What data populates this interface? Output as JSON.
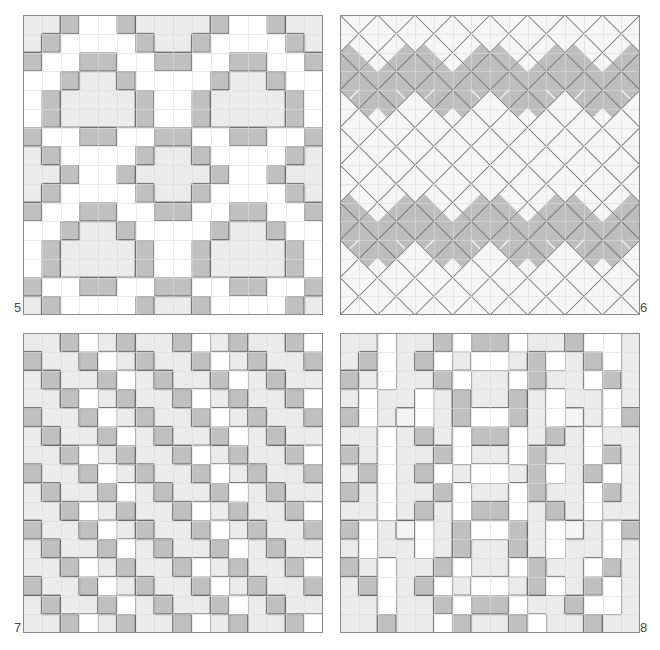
{
  "sheet": {
    "width": 660,
    "height": 650,
    "background": "#ffffff",
    "description": "Four numbered mosaic tiling pattern plates arranged two by two"
  },
  "palette": {
    "white": "#ffffff",
    "light_gray": "#ebebeb",
    "pale_gray": "#f4f4f4",
    "mid_gray": "#c0c0c0",
    "dark_gray": "#aeaeae",
    "grid_line_light": "#dcdcdc",
    "grid_line_strong": "#707070",
    "outline": "#6e6e6e",
    "label_color": "#4a4a4a",
    "border": "#8a8a8a"
  },
  "plates": [
    {
      "label": "5",
      "label_position": "bottom-left",
      "x": 23,
      "y": 15,
      "size": 300,
      "grid": 16,
      "pattern_type": "octagon-rosette",
      "cell_size": 18.75,
      "description": "Sixteen by sixteen square grid with light gray octagonal rosettes outlined by mid gray tiles on a white ground",
      "cells": [
        "LLGWWGLLLLGWWGLL",
        "LGWWWWGLLGWWWWGL",
        "GWWGGWWGGWWGGWWG",
        "WWGLLGWWWWGLLGWW",
        "WGLLLLGWWGLLLLGW",
        "WGLLLLGWWGLLLLGW",
        "GWWGGWWGGWWGGWWG",
        "LGWWWWGLLGWWWWGL",
        "LLGWWGLLLLGWWGLL",
        "LGWWWWGLLGWWWWGL",
        "GWWGGWWGGWWGGWWG",
        "WWGLLGWWWWGLLGWW",
        "WGLLLLGWWGLLLLGW",
        "WGLLLLGWWGLLLLGW",
        "GWWGGWWGGWWGGWWG",
        "LGWWWWGLLGWWWWGL"
      ]
    },
    {
      "label": "6",
      "label_position": "bottom-right",
      "x": 340,
      "y": 15,
      "size": 300,
      "grid": 16,
      "pattern_type": "diagonal-zigzag-triangles",
      "cell_size": 18.75,
      "description": "Square grid overlaid with full diagonal lattice forming zigzag bands of mid gray triangles on pale ground",
      "band_rows": [
        2,
        3,
        10,
        11
      ],
      "band_shade": "#bdbdbd",
      "field_shade": "#f6f6f6"
    },
    {
      "label": "7",
      "label_position": "bottom-left",
      "x": 23,
      "y": 333,
      "size": 300,
      "grid": 16,
      "pattern_type": "dense-checker-diaper",
      "cell_size": 18.75,
      "description": "Dense diaper pattern of alternating light gray, mid gray and white squares",
      "cells": [
        "LLGWLGLLGWLGLLGW",
        "GLLGWLGLLGWLGLLG",
        "LGLLGWLGLLGWLGLL",
        "LLGWLGLLGWLGLLGW",
        "GLLGWLGLLGWLGLLG",
        "LGLLGWLGLLGWLGLL",
        "LLGWLGLLGWLGLLGW",
        "GLLGWLGLLGWLGLLG",
        "LGLLGWLGLLGWLGLL",
        "LLGWLGLLGWLGLLGW",
        "GLLGWLGLLGWLGLLG",
        "LGLLGWLGLLGWLGLL",
        "LLGWLGLLGWLGLLGW",
        "GLLGWLGLLGWLGLLG",
        "LGLLGWLGLLGWLGLL",
        "LLGWLGLLGWLGLLGW"
      ]
    },
    {
      "label": "8",
      "label_position": "bottom-right",
      "x": 340,
      "y": 333,
      "size": 300,
      "grid": 16,
      "pattern_type": "diamond-lozenge-medallion",
      "cell_size": 18.75,
      "description": "Lozenge medallions of mid gray squares framing small light gray centers on a pale gray ground",
      "cells": [
        "LLWLLGWGGWLLGWWL",
        "LGWLGWLWWLGWLGWL",
        "GLWLLGWLLWGLLWGL",
        "LWLLWLGLLGLWLLWL",
        "GWLPWLGWWGLWPLWG",
        "LLWLGLWGGWLGLWLL",
        "GLWLLGWLLWGLLWGL",
        "LGWLGWLWWLGWLGWL",
        "GLWLLGWLLWGLLWGL",
        "LLWLGLWGGWLGLWLL",
        "GWLPWLGWWGLWPLWG",
        "LWLLWLGLLGLWLLWL",
        "GLWLLGWLLWGLLWGL",
        "LGWLGWLWWLGWLGWL",
        "LLWLLGWGGWLLGWWL",
        "LLGLLWGLLGWLLGLL"
      ]
    }
  ]
}
